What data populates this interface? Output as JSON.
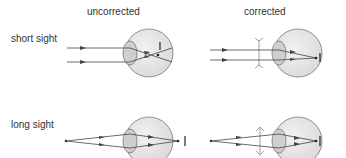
{
  "headers": {
    "uncorrected": "uncorrected",
    "corrected": "corrected"
  },
  "rows": {
    "short_sight": "short sight",
    "long_sight": "long sight"
  },
  "colors": {
    "eye_fill": "#e6e6e6",
    "eye_stroke": "#777777",
    "lens_fill": "#cfcfcf",
    "ray": "#444444",
    "text": "#333333"
  }
}
